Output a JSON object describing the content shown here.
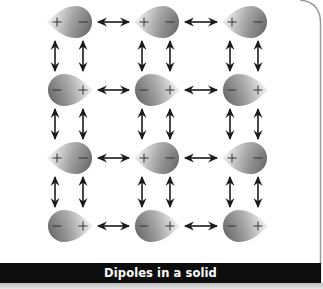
{
  "caption": "Dipoles in a solid",
  "colors": {
    "dipole_dark": "#6e6e6e",
    "dipole_light": "#f4f4f4",
    "arrow": "#1a1a1a",
    "caption_bg": "#0d0d0d",
    "caption_text": "#ffffff",
    "frame": "#9a9a9a"
  },
  "grid": {
    "rows": 4,
    "cols": 3,
    "row_centers_y": [
      22,
      90,
      158,
      226
    ],
    "col_centers_x": [
      70,
      157,
      245
    ]
  },
  "dipoles": [
    {
      "row": 0,
      "col": 0,
      "left_sign": "+",
      "right_sign": "−"
    },
    {
      "row": 0,
      "col": 1,
      "left_sign": "+",
      "right_sign": "−"
    },
    {
      "row": 0,
      "col": 2,
      "left_sign": "+",
      "right_sign": "−"
    },
    {
      "row": 1,
      "col": 0,
      "left_sign": "−",
      "right_sign": "+"
    },
    {
      "row": 1,
      "col": 1,
      "left_sign": "−",
      "right_sign": "+"
    },
    {
      "row": 1,
      "col": 2,
      "left_sign": "−",
      "right_sign": "+"
    },
    {
      "row": 2,
      "col": 0,
      "left_sign": "+",
      "right_sign": "−"
    },
    {
      "row": 2,
      "col": 1,
      "left_sign": "+",
      "right_sign": "−"
    },
    {
      "row": 2,
      "col": 2,
      "left_sign": "+",
      "right_sign": "−"
    },
    {
      "row": 3,
      "col": 0,
      "left_sign": "−",
      "right_sign": "+"
    },
    {
      "row": 3,
      "col": 1,
      "left_sign": "−",
      "right_sign": "+"
    },
    {
      "row": 3,
      "col": 2,
      "left_sign": "−",
      "right_sign": "+"
    }
  ],
  "arrows": {
    "horizontal": "double-headed arrows between neighboring dipoles in each row",
    "vertical": "two double-headed arrows between vertically neighboring dipoles"
  }
}
